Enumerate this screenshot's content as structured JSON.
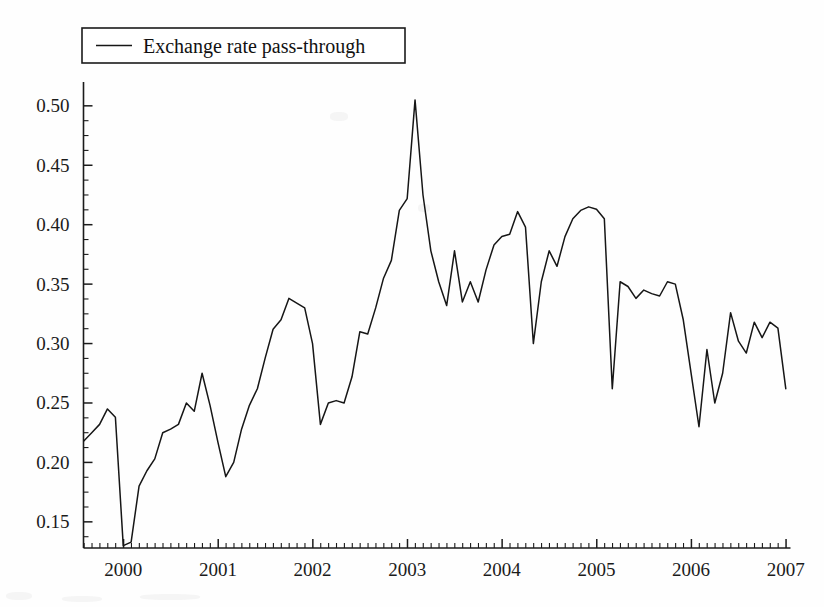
{
  "figure": {
    "background_color": "#fefefe",
    "line_color": "#161616",
    "axis_color": "#1b1b1b"
  },
  "legend": {
    "label": "Exchange rate pass-through",
    "position": "top-left",
    "boxed": true
  },
  "chart_data": {
    "type": "line",
    "title": "",
    "subtitle": "",
    "xlabel": "",
    "ylabel": "",
    "legend": [
      "Exchange rate pass-through"
    ],
    "legend_position": "top-left",
    "grid": false,
    "xlim": [
      1999.58,
      2007.05
    ],
    "ylim": [
      0.128,
      0.515
    ],
    "yticks": [
      0.15,
      0.2,
      0.25,
      0.3,
      0.35,
      0.4,
      0.45,
      0.5
    ],
    "ytick_labels": [
      "0.15",
      "0.20",
      "0.25",
      "0.30",
      "0.35",
      "0.40",
      "0.45",
      "0.50"
    ],
    "yminor_step": 0.0125,
    "xticks": [
      2000,
      2001,
      2002,
      2003,
      2004,
      2005,
      2006,
      2007
    ],
    "xtick_labels": [
      "2000",
      "2001",
      "2002",
      "2003",
      "2004",
      "2005",
      "2006",
      "2007"
    ],
    "xminor_step": 0.08333,
    "series": [
      {
        "name": "Exchange rate pass-through",
        "x": [
          1999.583,
          1999.667,
          1999.75,
          1999.833,
          1999.917,
          2000.0,
          2000.083,
          2000.167,
          2000.25,
          2000.333,
          2000.417,
          2000.5,
          2000.583,
          2000.667,
          2000.75,
          2000.833,
          2000.917,
          2001.0,
          2001.083,
          2001.167,
          2001.25,
          2001.333,
          2001.417,
          2001.5,
          2001.583,
          2001.667,
          2001.75,
          2001.833,
          2001.917,
          2002.0,
          2002.083,
          2002.167,
          2002.25,
          2002.333,
          2002.417,
          2002.5,
          2002.583,
          2002.667,
          2002.75,
          2002.833,
          2002.917,
          2003.0,
          2003.083,
          2003.167,
          2003.25,
          2003.333,
          2003.417,
          2003.5,
          2003.583,
          2003.667,
          2003.75,
          2003.833,
          2003.917,
          2004.0,
          2004.083,
          2004.167,
          2004.25,
          2004.333,
          2004.417,
          2004.5,
          2004.583,
          2004.667,
          2004.75,
          2004.833,
          2004.917,
          2005.0,
          2005.083,
          2005.167,
          2005.25,
          2005.333,
          2005.417,
          2005.5,
          2005.583,
          2005.667,
          2005.75,
          2005.833,
          2005.917,
          2006.0,
          2006.083,
          2006.167,
          2006.25,
          2006.333,
          2006.417,
          2006.5,
          2006.583,
          2006.667,
          2006.75,
          2006.833,
          2006.917,
          2007.0
        ],
        "y": [
          0.218,
          0.225,
          0.232,
          0.245,
          0.238,
          0.13,
          0.133,
          0.18,
          0.193,
          0.203,
          0.225,
          0.228,
          0.232,
          0.25,
          0.243,
          0.275,
          0.248,
          0.217,
          0.188,
          0.2,
          0.228,
          0.248,
          0.262,
          0.288,
          0.312,
          0.32,
          0.338,
          0.334,
          0.33,
          0.3,
          0.232,
          0.25,
          0.252,
          0.25,
          0.272,
          0.31,
          0.308,
          0.33,
          0.355,
          0.37,
          0.412,
          0.422,
          0.505,
          0.425,
          0.378,
          0.352,
          0.332,
          0.378,
          0.335,
          0.352,
          0.335,
          0.362,
          0.383,
          0.39,
          0.392,
          0.411,
          0.398,
          0.3,
          0.352,
          0.378,
          0.365,
          0.39,
          0.405,
          0.412,
          0.415,
          0.413,
          0.405,
          0.262,
          0.352,
          0.348,
          0.338,
          0.345,
          0.342,
          0.34,
          0.352,
          0.35,
          0.32,
          0.275,
          0.23,
          0.295,
          0.25,
          0.275,
          0.326,
          0.302,
          0.292,
          0.318,
          0.305,
          0.318,
          0.313,
          0.262
        ]
      }
    ]
  }
}
